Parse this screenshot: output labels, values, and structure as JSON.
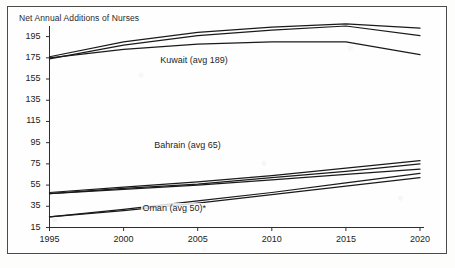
{
  "chart_data": {
    "type": "line",
    "title": "Net Annual Additions of Nurses",
    "xlabel": "",
    "ylabel": "",
    "xlim": [
      1995,
      2020
    ],
    "ylim": [
      15,
      205
    ],
    "grid": false,
    "legend_position": "inline-annotations",
    "x_ticks": [
      "1995",
      "2000",
      "2005",
      "2010",
      "2015",
      "2020"
    ],
    "y_ticks": [
      "15",
      "35",
      "55",
      "75",
      "95",
      "115",
      "135",
      "155",
      "175",
      "195"
    ],
    "x": [
      1995,
      2000,
      2005,
      2010,
      2015,
      2020
    ],
    "annotations": [
      {
        "text": "Kuwait (avg 189)",
        "x": 2002.4,
        "y": 172
      },
      {
        "text": "Bahrain (avg 65)",
        "x": 2002.0,
        "y": 92
      },
      {
        "text": "Oman (avg 50)*",
        "x": 2001.2,
        "y": 32
      }
    ],
    "series": [
      {
        "name": "Kuwait high",
        "group": "Kuwait",
        "values": [
          176,
          190,
          199,
          204,
          207,
          203
        ]
      },
      {
        "name": "Kuwait mid",
        "group": "Kuwait",
        "values": [
          174,
          187,
          196,
          201,
          205,
          196
        ]
      },
      {
        "name": "Kuwait low",
        "group": "Kuwait",
        "values": [
          175,
          183,
          188,
          190,
          190,
          178
        ]
      },
      {
        "name": "Bahrain high",
        "group": "Bahrain",
        "values": [
          48,
          53,
          58,
          64,
          71,
          78
        ]
      },
      {
        "name": "Bahrain mid",
        "group": "Bahrain",
        "values": [
          47,
          52,
          56,
          62,
          68,
          75
        ]
      },
      {
        "name": "Bahrain low",
        "group": "Bahrain",
        "values": [
          47,
          51,
          55,
          60,
          65,
          70
        ]
      },
      {
        "name": "Oman high",
        "group": "Oman",
        "values": [
          25,
          32,
          40,
          48,
          57,
          66
        ]
      },
      {
        "name": "Oman low",
        "group": "Oman",
        "values": [
          25,
          31,
          38,
          46,
          54,
          62
        ]
      }
    ]
  },
  "footnote": {
    "marker": "*"
  }
}
